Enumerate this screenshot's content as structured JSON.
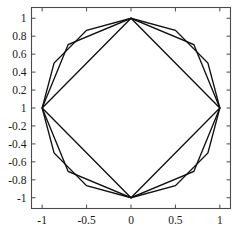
{
  "chart_data": {
    "type": "line",
    "title": "",
    "xlabel": "",
    "ylabel": "",
    "xlim": [
      -1.12,
      1.12
    ],
    "ylim": [
      -1.12,
      1.12
    ],
    "grid": false,
    "legend": "none",
    "xticks": [
      -1,
      -0.5,
      0,
      0.5,
      1
    ],
    "xtick_labels": [
      "-1",
      "-0.5",
      "0",
      "0.5",
      "1"
    ],
    "yticks": [
      1,
      0.8,
      0.6,
      0.4,
      0.2,
      0,
      -0.2,
      -0.4,
      -0.6,
      -0.8,
      -1
    ],
    "ytick_labels": [
      "1",
      "0.8",
      "0.6",
      "0.4",
      "0.2",
      "1",
      "-0.2",
      "-0.4",
      "-0.6",
      "-0.8",
      "-1"
    ],
    "series": [
      {
        "name": "square",
        "n_sides": 4,
        "closed": true,
        "points": [
          [
            1,
            0
          ],
          [
            0,
            1
          ],
          [
            -1,
            0
          ],
          [
            0,
            -1
          ]
        ]
      },
      {
        "name": "octagon",
        "n_sides": 8,
        "closed": true,
        "points": [
          [
            1,
            0
          ],
          [
            0.7071,
            0.7071
          ],
          [
            0,
            1
          ],
          [
            -0.7071,
            0.7071
          ],
          [
            -1,
            0
          ],
          [
            -0.7071,
            -0.7071
          ],
          [
            0,
            -1
          ],
          [
            0.7071,
            -0.7071
          ]
        ]
      },
      {
        "name": "dodecagon",
        "n_sides": 12,
        "closed": true,
        "points": [
          [
            1,
            0
          ],
          [
            0.866,
            0.5
          ],
          [
            0.5,
            0.866
          ],
          [
            0,
            1
          ],
          [
            -0.5,
            0.866
          ],
          [
            -0.866,
            0.5
          ],
          [
            -1,
            0
          ],
          [
            -0.866,
            -0.5
          ],
          [
            -0.5,
            -0.866
          ],
          [
            0,
            -1
          ],
          [
            0.5,
            -0.866
          ],
          [
            0.866,
            -0.5
          ]
        ]
      }
    ]
  },
  "axes": {
    "frame_color": "#4a4a4a",
    "line_color": "#101010"
  }
}
